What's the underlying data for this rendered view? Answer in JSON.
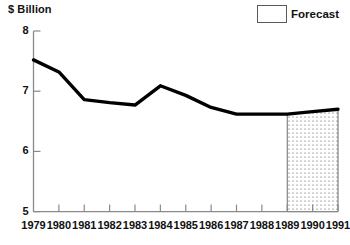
{
  "chart_data": {
    "type": "line",
    "title": "",
    "subtitle": "",
    "xlabel": "",
    "ylabel": "$ Billion",
    "ylim": [
      5,
      8
    ],
    "yticks": [
      5,
      6,
      7,
      8
    ],
    "ytick_labels": [
      "5",
      "6",
      "7",
      "8"
    ],
    "grid": false,
    "legend_position": "top-right",
    "categories": [
      1979,
      1980,
      1981,
      1982,
      1983,
      1984,
      1985,
      1986,
      1987,
      1988,
      1989,
      1990,
      1991
    ],
    "xtick_labels": [
      "1979",
      "1980",
      "1981",
      "1982",
      "1983",
      "1984",
      "1985",
      "1986",
      "1987",
      "1988",
      "1989",
      "1990",
      "1991"
    ],
    "series": [
      {
        "name": "Value",
        "values": [
          7.52,
          7.32,
          6.86,
          6.81,
          6.77,
          7.09,
          6.93,
          6.73,
          6.62,
          6.62,
          6.62,
          6.66,
          6.7
        ]
      }
    ],
    "annotations": [
      {
        "name": "forecast-region",
        "label": "Forecast",
        "x_start": 1989,
        "x_end": 1991,
        "fill": "stipple"
      }
    ]
  },
  "axis": {
    "unit_caption": "$ Billion",
    "unit_symbol": "$",
    "unit_word": "Billion"
  },
  "legend": {
    "entries": [
      {
        "label": "Forecast",
        "pattern": "stipple"
      }
    ]
  },
  "colors": {
    "line": "#000000",
    "axis": "#8a8a8a",
    "text": "#111111",
    "forecast_border": "#5a5a5a",
    "forecast_dot": "#4a4a4a",
    "background": "#ffffff"
  }
}
